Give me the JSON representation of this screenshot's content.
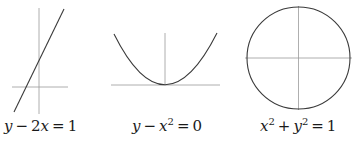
{
  "colors": {
    "background": "#ffffff",
    "curve": "#3a3a3a",
    "axis": "#9a9a9a",
    "text": "#1a1a1a"
  },
  "graphs": [
    {
      "id": "linear",
      "equation": "y − 2x = 1",
      "parts": {
        "lhs_var": "y",
        "minus": "−",
        "coef_var": "2x",
        "eq": "=",
        "rhs": "1"
      },
      "type": "line"
    },
    {
      "id": "parabola",
      "equation": "y − x² = 0",
      "parts": {
        "lhs_var": "y",
        "minus": "−",
        "var": "x",
        "exp": "2",
        "eq": "=",
        "rhs": "0"
      },
      "type": "parabola"
    },
    {
      "id": "circle",
      "equation": "x² + y² = 1",
      "parts": {
        "var1": "x",
        "exp1": "2",
        "plus": "+",
        "var2": "y",
        "exp2": "2",
        "eq": "=",
        "rhs": "1"
      },
      "type": "circle"
    }
  ]
}
